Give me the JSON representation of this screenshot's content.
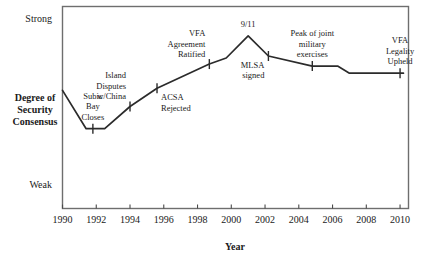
{
  "chart_data": {
    "type": "line",
    "title": "",
    "xlabel": "Year",
    "ylabel": "Degree of Security Consensus",
    "xlim": [
      1990,
      2010.5
    ],
    "ylim": [
      0,
      10
    ],
    "grid": false,
    "legend": "none",
    "x_ticks": [
      "1990",
      "1992",
      "1994",
      "1996",
      "1998",
      "2000",
      "2002",
      "2004",
      "2006",
      "2008",
      "2010"
    ],
    "x_tick_values": [
      1990,
      1992,
      1994,
      1996,
      1998,
      2000,
      2002,
      2004,
      2006,
      2008,
      2010
    ],
    "y_category_labels": [
      {
        "label": "Strong",
        "value": 9.4
      },
      {
        "label": "Weak",
        "value": 1.2
      }
    ],
    "series": [
      {
        "name": "Degree of Security Consensus",
        "x": [
          1990.0,
          1991.4,
          1992.5,
          1994.0,
          1995.6,
          1998.7,
          1999.7,
          2001.0,
          2002.2,
          2004.8,
          2006.3,
          2007.0,
          2010.2
        ],
        "y": [
          5.85,
          3.95,
          3.95,
          5.05,
          5.95,
          7.15,
          7.45,
          8.55,
          7.55,
          7.05,
          7.05,
          6.7,
          6.7
        ]
      }
    ],
    "annotations": [
      {
        "text": "Subic Bay Closes",
        "lines": [
          "Subic",
          "Bay",
          "Closes"
        ],
        "x": 1991.8,
        "y": 3.95,
        "marker": true,
        "label_position": "above"
      },
      {
        "text": "Island Disputes w/China",
        "lines": [
          "Island",
          "Disputes",
          "w/China"
        ],
        "x": 1994.0,
        "y": 5.05,
        "marker": true,
        "label_position": "above-left"
      },
      {
        "text": "ACSA Rejected",
        "lines": [
          "ACSA",
          "Rejected"
        ],
        "x": 1995.6,
        "y": 5.95,
        "marker": true,
        "label_position": "below-right"
      },
      {
        "text": "VFA Agreement Ratified",
        "lines": [
          "VFA",
          "Agreement",
          "Ratified"
        ],
        "x": 1998.7,
        "y": 7.15,
        "marker": true,
        "label_position": "above-left"
      },
      {
        "text": "9/11",
        "lines": [
          "9/11"
        ],
        "x": 2001.0,
        "y": 8.55,
        "marker": false,
        "label_position": "above"
      },
      {
        "text": "MLSA signed",
        "lines": [
          "MLSA",
          "signed"
        ],
        "x": 2002.2,
        "y": 7.55,
        "marker": true,
        "label_position": "below-left"
      },
      {
        "text": "Peak of joint military exercises",
        "lines": [
          "Peak of joint",
          "military",
          "exercises"
        ],
        "x": 2004.8,
        "y": 7.05,
        "marker": true,
        "label_position": "above"
      },
      {
        "text": "VFA Legality Upheld",
        "lines": [
          "VFA",
          "Legality",
          "Upheld"
        ],
        "x": 2010.0,
        "y": 6.7,
        "marker": true,
        "label_position": "above"
      }
    ],
    "colors": {
      "line": "#2b2b2b",
      "frame": "#6e6e6e",
      "text": "#1a1a1a",
      "background": "#ffffff"
    }
  }
}
